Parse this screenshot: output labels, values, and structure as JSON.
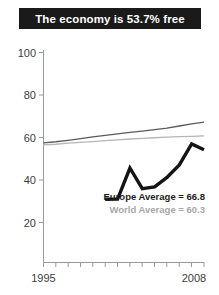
{
  "title": {
    "text": "The economy is 53.7% free"
  },
  "colors": {
    "banner_background": "#1a1a1a",
    "banner_text": "#ffffff",
    "country_line": "#141414",
    "europe_line": "#5a5a5a",
    "world_line": "#b5b5b5",
    "axis": "#9a9a9a",
    "tick_text": "#3d3d3d"
  },
  "annotations": {
    "europe": "Europe Average = 66.8",
    "world": "World Average = 60.3"
  },
  "chart_data": {
    "type": "line",
    "title": "The economy is 53.7% free",
    "xlabel": "",
    "ylabel": "",
    "xlim": [
      1995,
      2008
    ],
    "ylim": [
      0,
      100
    ],
    "yticks": [
      20,
      40,
      60,
      80,
      100
    ],
    "ytick_labels": [
      "20",
      "40",
      "60",
      "80",
      "100"
    ],
    "xticks": [
      1995,
      1996,
      1997,
      1998,
      1999,
      2000,
      2001,
      2002,
      2003,
      2004,
      2005,
      2006,
      2007,
      2008
    ],
    "xtick_labels_shown": [
      "1995",
      "2008"
    ],
    "grid": false,
    "legend": "inline-annotations",
    "x": [
      1995,
      1996,
      1997,
      1998,
      1999,
      2000,
      2001,
      2002,
      2003,
      2004,
      2005,
      2006,
      2007,
      2008
    ],
    "series": [
      {
        "name": "Country",
        "style": "thick-black",
        "x": [
          2000,
          2001,
          2002,
          2003,
          2004,
          2005,
          2006,
          2007,
          2008
        ],
        "values": [
          30.1,
          30.2,
          45.0,
          35.2,
          36.0,
          40.5,
          46.5,
          56.5,
          53.7
        ]
      },
      {
        "name": "Europe Average",
        "style": "thin-dark-gray",
        "x": [
          1995,
          1996,
          1997,
          1998,
          1999,
          2000,
          2001,
          2002,
          2003,
          2004,
          2005,
          2006,
          2007,
          2008
        ],
        "values": [
          57.0,
          57.5,
          58.2,
          59.0,
          59.8,
          60.5,
          61.3,
          62.0,
          62.6,
          63.3,
          64.0,
          65.0,
          66.0,
          66.8
        ]
      },
      {
        "name": "World Average",
        "style": "thin-light-gray",
        "x": [
          1995,
          1996,
          1997,
          1998,
          1999,
          2000,
          2001,
          2002,
          2003,
          2004,
          2005,
          2006,
          2007,
          2008
        ],
        "values": [
          56.0,
          56.3,
          56.8,
          57.2,
          57.6,
          58.0,
          58.4,
          58.8,
          59.1,
          59.4,
          59.7,
          59.9,
          60.1,
          60.3
        ]
      }
    ],
    "endpoint_labels": {
      "europe": 66.8,
      "world": 60.3,
      "country": 53.7
    }
  }
}
